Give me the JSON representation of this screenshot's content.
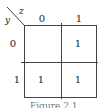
{
  "kmap": {
    "row_variable": "y",
    "col_variable": "z",
    "col_headers": [
      "0",
      "1"
    ],
    "row_headers": [
      "0",
      "1"
    ],
    "cells": [
      [
        "",
        "1"
      ],
      [
        "1",
        "1"
      ]
    ]
  },
  "caption": "Figure 2.1"
}
